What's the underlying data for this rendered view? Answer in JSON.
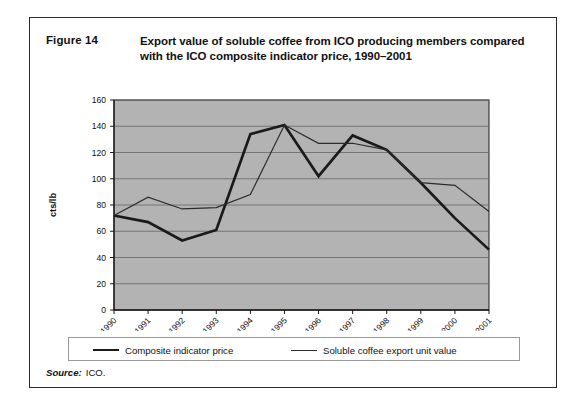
{
  "figure": {
    "number": "Figure 14",
    "title": "Export value of soluble coffee from ICO producing members compared with the ICO composite indicator price, 1990–2001"
  },
  "source": {
    "label": "Source:",
    "value": "ICO."
  },
  "legend": {
    "items": [
      {
        "label": "Composite indicator price",
        "style": "bold",
        "color": "#1a1a1a"
      },
      {
        "label": "Soluble coffee export unit value",
        "style": "thin",
        "color": "#2b2b2b"
      }
    ]
  },
  "colors": {
    "plot_background": "#b3b3b3",
    "gridline": "#6e6e6e",
    "axis": "#1a1a1a",
    "series_composite": "#1a1a1a",
    "series_soluble": "#2b2b2b",
    "card_border": "#2b2b2b",
    "text": "#111111"
  },
  "chart_data": {
    "type": "line",
    "title": "Export value of soluble coffee from ICO producing members compared with the ICO composite indicator price, 1990–2001",
    "xlabel": "",
    "ylabel": "cts/lb",
    "ylim": [
      0,
      160
    ],
    "ytick_step": 20,
    "yticks": [
      0,
      20,
      40,
      60,
      80,
      100,
      120,
      140,
      160
    ],
    "grid": true,
    "grid_axis": "y",
    "legend_position": "bottom",
    "categories": [
      "1990",
      "1991",
      "1992",
      "1993",
      "1994",
      "1995",
      "1996",
      "1997",
      "1998",
      "1999",
      "2000",
      "2001"
    ],
    "series": [
      {
        "name": "Composite indicator price",
        "values": [
          72,
          67,
          53,
          61,
          134,
          141,
          102,
          133,
          122,
          97,
          70,
          46
        ]
      },
      {
        "name": "Soluble coffee export unit value",
        "values": [
          72,
          86,
          77,
          78,
          88,
          141,
          127,
          127,
          122,
          97,
          95,
          75
        ]
      }
    ]
  }
}
